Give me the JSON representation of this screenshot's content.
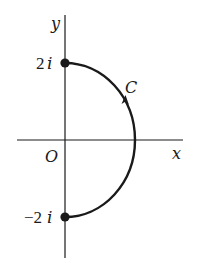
{
  "diagram": {
    "type": "complex-plane-contour",
    "axes": {
      "x_label": "x",
      "y_label": "y",
      "origin_label": "O"
    },
    "points": [
      {
        "label": "2i",
        "re": 0,
        "im": 2,
        "marker": "filled-dot"
      },
      {
        "label": "−2i",
        "re": 0,
        "im": -2,
        "marker": "filled-dot"
      }
    ],
    "contour": {
      "label": "C",
      "shape": "right semicircle from -2i to 2i",
      "direction": "counterclockwise (upward)"
    },
    "colors": {
      "stroke": "#1a1a1a",
      "background": "#ffffff"
    }
  },
  "labels": {
    "y": "y",
    "x": "x",
    "origin": "O",
    "top_point": "2i",
    "top_point_num": "2",
    "top_point_i": "i",
    "bottom_point_num": "−2",
    "bottom_point_i": "i",
    "contour": "C"
  }
}
